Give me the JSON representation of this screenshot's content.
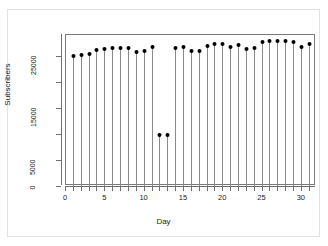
{
  "chart_data": {
    "type": "scatter",
    "title": "",
    "xlabel": "Day",
    "ylabel": "Subscribers",
    "xlim": [
      0,
      31.8
    ],
    "ylim": [
      0,
      29000
    ],
    "grid": false,
    "legend": null,
    "x_ticks": [
      0,
      5,
      10,
      15,
      20,
      25,
      30
    ],
    "x_tick_labels": [
      "0",
      "5",
      "10",
      "15",
      "20",
      "25",
      "30"
    ],
    "x_minor_tick_step": 1,
    "y_ticks": [
      0,
      5000,
      15000,
      25000
    ],
    "y_tick_labels": [
      "0",
      "5000",
      "15000",
      "25000"
    ],
    "y_minor_tick_step": 5000,
    "marker": "filled-circle",
    "stems": true,
    "x": [
      1,
      2,
      3,
      4,
      5,
      6,
      7,
      8,
      9,
      10,
      11,
      12,
      13,
      14,
      15,
      16,
      17,
      18,
      19,
      20,
      21,
      22,
      23,
      24,
      25,
      26,
      27,
      28,
      29,
      30,
      31
    ],
    "categories": [
      "1",
      "2",
      "3",
      "4",
      "5",
      "6",
      "7",
      "8",
      "9",
      "10",
      "11",
      "12",
      "13",
      "14",
      "15",
      "16",
      "17",
      "18",
      "19",
      "20",
      "21",
      "22",
      "23",
      "24",
      "25",
      "26",
      "27",
      "28",
      "29",
      "30",
      "31"
    ],
    "values": [
      25000,
      25200,
      25400,
      26100,
      26400,
      26500,
      26600,
      26500,
      25700,
      26000,
      26800,
      9800,
      9800,
      26500,
      26700,
      26000,
      25900,
      26900,
      27200,
      27200,
      26800,
      27100,
      26300,
      26600,
      27600,
      27800,
      27900,
      27800,
      27700,
      26800,
      27200
    ]
  },
  "axes": {
    "y_title": "Subscribers",
    "x_title": "Day"
  }
}
